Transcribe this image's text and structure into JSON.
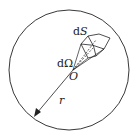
{
  "diagram": {
    "labels": {
      "surface_element": "dS",
      "solid_angle": "dΩ",
      "origin": "O",
      "radius": "r"
    },
    "colors": {
      "stroke": "#222222",
      "background": "#ffffff"
    }
  }
}
